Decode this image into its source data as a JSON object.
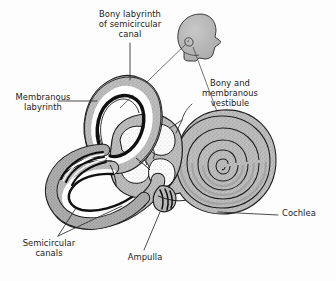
{
  "figure": {
    "background_color": "#fdfdfd",
    "ink_color": "#1a1a1a",
    "bone_gray": "#b4b4b4",
    "bone_gray_light": "#c9c9c9",
    "membrane_black": "#101010",
    "lumen_white": "#ffffff",
    "leader_color": "#2b2b2b"
  },
  "labels": {
    "bony_labyrinth": "Bony labyrinth\nof semicircular\ncanal",
    "bony_membranous_vestibule": "Bony and\nmembranous\nvestibule",
    "membranous_labyrinth": "Membranous\nlabyrinth",
    "semicircular_canals": "Semicircular\ncanals",
    "ampulla": "Ampulla",
    "cochlea": "Cochlea"
  },
  "parts": {
    "head_silhouette": "head-profile",
    "superior_canal": "superior-semicircular-canal",
    "lateral_canal": "lateral-semicircular-canal",
    "posterior_canal": "posterior-semicircular-canal",
    "vestibule": "vestibule",
    "ampulla": "ampulla",
    "cochlea": "cochlea-spiral",
    "cochlea_turns": 2.6
  }
}
